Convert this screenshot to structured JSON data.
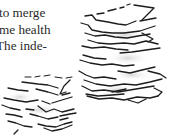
{
  "article": {
    "lines": [
      "to merge",
      "me health",
      "The inde-"
    ]
  },
  "illustration": {
    "description": "pencil sketch of two stacks of papers",
    "stroke_color": "#1c1c1c",
    "shadow_color": "#d8d8d8"
  }
}
